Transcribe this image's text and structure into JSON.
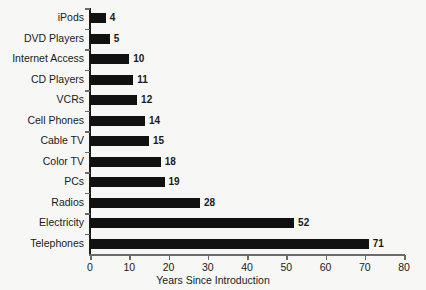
{
  "chart_data": {
    "type": "bar",
    "orientation": "horizontal",
    "title": "",
    "xlabel": "Years Since Introduction",
    "ylabel": "",
    "xlim": [
      0,
      80
    ],
    "xticks": [
      0,
      10,
      20,
      30,
      40,
      50,
      60,
      70,
      80
    ],
    "grid": false,
    "legend": false,
    "bar_color": "#111111",
    "axis_color": "#6b6b6b",
    "background": "#f7f7f5",
    "categories": [
      "iPods",
      "DVD Players",
      "Internet Access",
      "CD Players",
      "VCRs",
      "Cell Phones",
      "Cable TV",
      "Color TV",
      "PCs",
      "Radios",
      "Electricity",
      "Telephones"
    ],
    "values": [
      4,
      5,
      10,
      11,
      12,
      14,
      15,
      18,
      19,
      28,
      52,
      71
    ],
    "value_labels": [
      "4",
      "5",
      "10",
      "11",
      "12",
      "14",
      "15",
      "18",
      "19",
      "28",
      "52",
      "71"
    ]
  }
}
